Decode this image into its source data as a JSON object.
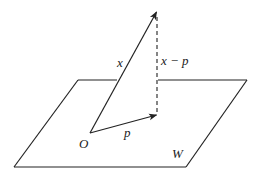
{
  "diagram": {
    "plane": {
      "label": "W",
      "corners": {
        "top_left": [
          78,
          80
        ],
        "top_right": [
          247,
          80
        ],
        "bottom_right": [
          186,
          167
        ],
        "bottom_left": [
          14,
          167
        ]
      }
    },
    "origin": {
      "label": "O",
      "point": [
        90,
        133
      ]
    },
    "vectors": [
      {
        "name": "x",
        "label": "x",
        "from": [
          90,
          133
        ],
        "to": [
          157,
          11
        ],
        "style": "solid-arrow"
      },
      {
        "name": "p",
        "label": "p",
        "from": [
          90,
          133
        ],
        "to": [
          157,
          115
        ],
        "style": "solid-arrow"
      },
      {
        "name": "x-p",
        "label": "x − p",
        "from": [
          157,
          115
        ],
        "to": [
          157,
          14
        ],
        "style": "dashed"
      }
    ],
    "labels": {
      "x": "x",
      "p": "p",
      "x_minus_p": "x − p",
      "origin": "O",
      "plane": "W"
    }
  }
}
